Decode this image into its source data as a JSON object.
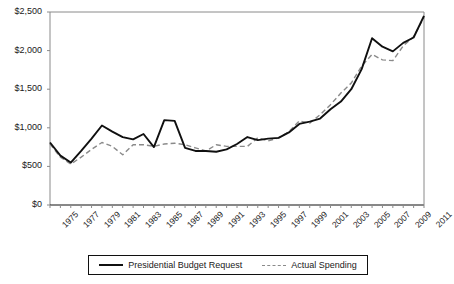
{
  "chart_data": {
    "type": "line",
    "title": "",
    "subtitle": "",
    "xlabel": "",
    "ylabel": "",
    "xlim": [
      1975,
      2011
    ],
    "ylim": [
      0,
      2500
    ],
    "ytick_values": [
      0,
      500,
      1000,
      1500,
      2000,
      2500
    ],
    "ytick_labels": [
      "$0",
      "$500",
      "$1,000",
      "$1,500",
      "$2,000",
      "$2,500"
    ],
    "xtick_labels": [
      "1975",
      "1977",
      "1979",
      "1981",
      "1983",
      "1985",
      "1987",
      "1989",
      "1991",
      "1993",
      "1995",
      "1997",
      "1999",
      "2001",
      "2003",
      "2005",
      "2007",
      "2009",
      "2011"
    ],
    "grid": false,
    "legend_position": "bottom",
    "x": [
      1975,
      1976,
      1977,
      1978,
      1979,
      1980,
      1981,
      1982,
      1983,
      1984,
      1985,
      1986,
      1987,
      1988,
      1989,
      1990,
      1991,
      1992,
      1993,
      1994,
      1995,
      1996,
      1997,
      1998,
      1999,
      2000,
      2001,
      2002,
      2003,
      2004,
      2005,
      2006,
      2007,
      2008,
      2009,
      2010,
      2011
    ],
    "series": [
      {
        "name": "Presidential Budget Request",
        "style": "solid",
        "color": "#101010",
        "values": [
          810,
          640,
          550,
          700,
          860,
          1030,
          950,
          880,
          850,
          920,
          750,
          1100,
          1090,
          740,
          700,
          700,
          690,
          720,
          790,
          880,
          840,
          860,
          870,
          940,
          1050,
          1080,
          1120,
          1240,
          1340,
          1500,
          1760,
          2160,
          2050,
          1990,
          2100,
          2170,
          2450
        ]
      },
      {
        "name": "Actual Spending",
        "style": "dashed",
        "color": "#8a8a8a",
        "values": [
          790,
          620,
          530,
          620,
          720,
          810,
          760,
          650,
          780,
          780,
          760,
          790,
          800,
          780,
          740,
          700,
          780,
          760,
          760,
          760,
          870,
          830,
          870,
          950,
          1090,
          1060,
          1170,
          1300,
          1450,
          1580,
          1800,
          1950,
          1880,
          1870,
          2060,
          2180,
          2430
        ]
      }
    ]
  },
  "legend": {
    "entries": [
      {
        "label": "Presidential Budget Request"
      },
      {
        "label": "Actual Spending"
      }
    ]
  }
}
